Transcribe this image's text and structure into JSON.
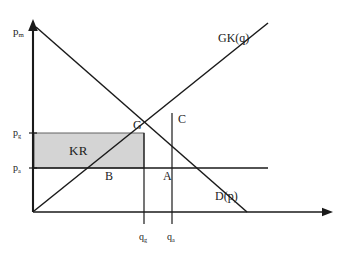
{
  "figure": {
    "type": "supply-demand-diagram",
    "background": "#ffffff",
    "line_color": "#1a1a1a",
    "shade_color": "#d4d4d4"
  },
  "axes": {
    "y_label": "p",
    "y_label_sub": "m",
    "x_label": "",
    "origin": {
      "x": 33,
      "y": 212
    },
    "y_top": {
      "x": 33,
      "y": 22
    },
    "x_right": {
      "x": 330,
      "y": 212
    }
  },
  "price_ticks": [
    {
      "id": "p-upper",
      "label": "p",
      "sub": "g",
      "y": 133
    },
    {
      "id": "p-lower",
      "label": "p",
      "sub": "a",
      "y": 168
    }
  ],
  "quantity_ticks": [
    {
      "id": "q-first",
      "label": "q",
      "sub": "g",
      "x": 144
    },
    {
      "id": "q-second",
      "label": "q",
      "sub": "a",
      "x": 172
    }
  ],
  "curves": [
    {
      "id": "demand",
      "label": "D",
      "label_paren": "(p)",
      "x": 215,
      "y": 196
    },
    {
      "id": "supply",
      "label": "GK",
      "label_paren": "(q)",
      "x": 218,
      "y": 38
    }
  ],
  "points": [
    {
      "id": "point-g",
      "label": "G",
      "x": 144,
      "y": 133
    },
    {
      "id": "point-c",
      "label": "C",
      "x": 172,
      "y": 120
    },
    {
      "id": "point-a",
      "label": "A",
      "x": 172,
      "y": 168
    },
    {
      "id": "point-b",
      "label": "B",
      "x": 110,
      "y": 168
    }
  ],
  "regions": [
    {
      "id": "kr-area",
      "label": "KR",
      "x1": 33,
      "y1": 133,
      "x2": 144,
      "y2": 168
    }
  ]
}
